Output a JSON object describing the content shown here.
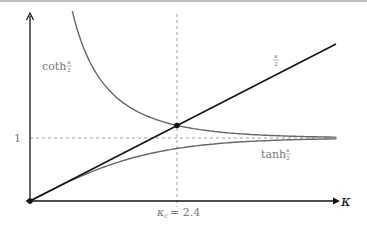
{
  "chart_data": {
    "type": "line",
    "title": "",
    "xlabel": "κ",
    "ylabel": "",
    "xlim": [
      0,
      5.0
    ],
    "ylim": [
      0,
      3.05
    ],
    "grid": false,
    "yticks": [
      {
        "value": 1,
        "label": "1"
      }
    ],
    "xticks": [
      {
        "value": 2.4,
        "label": "κc = 2.4"
      }
    ],
    "series": [
      {
        "name": "coth κ/2",
        "label_text": "coth",
        "fraction": "κ/2",
        "color": "#666666",
        "x": [
          0.69,
          1.0,
          1.5,
          2.0,
          2.4,
          3.0,
          4.0,
          5.0
        ],
        "y": [
          3.02,
          2.16,
          1.51,
          1.31,
          1.2,
          1.1,
          1.04,
          1.01
        ]
      },
      {
        "name": "κ/2",
        "label_text": "",
        "fraction": "κ/2",
        "color": "#111111",
        "x": [
          0,
          2.4,
          5.0
        ],
        "y": [
          0,
          1.2,
          2.5
        ]
      },
      {
        "name": "tanh κ/2",
        "label_text": "tanh",
        "fraction": "κ/2",
        "color": "#666666",
        "x": [
          0,
          0.5,
          1.0,
          1.5,
          2.0,
          2.4,
          3.0,
          4.0,
          5.0
        ],
        "y": [
          0,
          0.245,
          0.462,
          0.635,
          0.762,
          0.834,
          0.905,
          0.964,
          0.987
        ]
      }
    ],
    "annotations": [
      {
        "text": "1",
        "type": "hline-dashed",
        "y": 1
      },
      {
        "text": "κc = 2.4",
        "type": "vline-dashed",
        "x": 2.4
      },
      {
        "text": "intersection",
        "type": "point",
        "x": 2.4,
        "y": 1.2
      },
      {
        "text": "origin",
        "type": "point",
        "x": 0,
        "y": 0
      }
    ]
  },
  "labels": {
    "coth": "coth",
    "tanh": "tanh",
    "frac_num": "κ",
    "frac_den": "2",
    "y_one": "1",
    "kc_kappa": "κ",
    "kc_sub": "c",
    "kc_eq": "= 2.4",
    "x_axis": "κ"
  }
}
